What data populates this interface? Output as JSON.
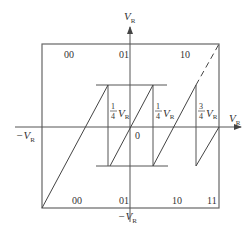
{
  "diagram": {
    "title": "",
    "colors": {
      "line": "#555555",
      "text": "#333333",
      "background": "#ffffff"
    },
    "axes": {
      "y_top_label": "V",
      "y_top_sub": "R",
      "y_bottom_label": "−V",
      "y_bottom_sub": "R",
      "x_right_label": "V",
      "x_right_sub": "R",
      "x_left_label": "−V",
      "x_left_sub": "R",
      "origin_label": "0"
    },
    "top_codes": [
      "00",
      "01",
      "10"
    ],
    "bottom_codes": [
      "00",
      "01",
      "10",
      "11"
    ],
    "threshold_labels": [
      {
        "num": "1",
        "den": "4",
        "var": "V",
        "sub": "R"
      },
      {
        "num": "1",
        "den": "4",
        "var": "V",
        "sub": "R"
      },
      {
        "num": "3",
        "den": "4",
        "var": "V",
        "sub": "R"
      }
    ]
  }
}
